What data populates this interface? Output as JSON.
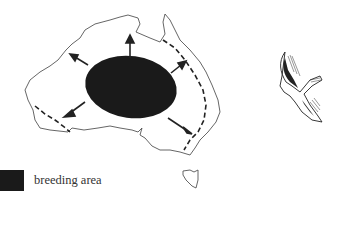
{
  "figure": {
    "legend": {
      "swatch_color": "#1a1a1a",
      "label": "breeding area"
    },
    "elements": {
      "breeding_area": "central Australia",
      "dispersal_arrows": [
        "north-west",
        "north",
        "north-east",
        "south-west",
        "south-east"
      ],
      "range_boundary": "dashed line",
      "illustration": "flying bird"
    },
    "colors": {
      "ink": "#1a1a1a",
      "outline": "#555555",
      "background": "#ffffff"
    }
  }
}
